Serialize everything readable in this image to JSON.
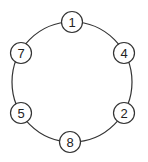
{
  "diagram": {
    "type": "cycle-graph",
    "ring": {
      "cx": 72,
      "cy": 82,
      "r": 60
    },
    "node_radius": 10.5,
    "nodes": [
      {
        "id": "1",
        "label": "1",
        "x": 72,
        "y": 22
      },
      {
        "id": "4",
        "label": "4",
        "x": 124,
        "y": 53
      },
      {
        "id": "2",
        "label": "2",
        "x": 124,
        "y": 113
      },
      {
        "id": "8",
        "label": "8",
        "x": 70,
        "y": 142
      },
      {
        "id": "5",
        "label": "5",
        "x": 21,
        "y": 113
      },
      {
        "id": "7",
        "label": "7",
        "x": 21,
        "y": 53
      }
    ],
    "edges": [
      [
        "1",
        "4"
      ],
      [
        "4",
        "2"
      ],
      [
        "2",
        "8"
      ],
      [
        "8",
        "5"
      ],
      [
        "5",
        "7"
      ],
      [
        "7",
        "1"
      ]
    ],
    "colors": {
      "stroke": "#333333",
      "fill": "#ffffff",
      "text": "#222222"
    }
  }
}
